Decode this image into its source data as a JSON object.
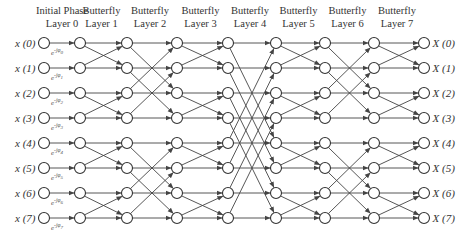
{
  "colors": {
    "line": "#444444",
    "node_stroke": "#333333",
    "text": "#333333",
    "background": "#ffffff"
  },
  "layers": [
    {
      "line1": "Initial Phase",
      "line2": "Layer 0",
      "x": 80
    },
    {
      "line1": "Butterfly",
      "line2": "Layer 1",
      "x": 127
    },
    {
      "line1": "Butterfly",
      "line2": "Layer 2",
      "x": 177
    },
    {
      "line1": "Butterfly",
      "line2": "Layer 3",
      "x": 228
    },
    {
      "line1": "Butterfly",
      "line2": "Layer 4",
      "x": 276
    },
    {
      "line1": "Butterfly",
      "line2": "Layer 5",
      "x": 325
    },
    {
      "line1": "Butterfly",
      "line2": "Layer 6",
      "x": 374
    },
    {
      "line1": "Butterfly",
      "line2": "Layer 7",
      "x": 424
    }
  ],
  "header_x": [
    80,
    102,
    152,
    202,
    252,
    301,
    350,
    399
  ],
  "input_x": 44,
  "rows_y": [
    43,
    68,
    93,
    118,
    143,
    168,
    193,
    218
  ],
  "inputs": [
    "x (0)",
    "x (1)",
    "x (2)",
    "x (3)",
    "x (4)",
    "x (5)",
    "x (6)",
    "x (7)"
  ],
  "outputs": [
    "X (0)",
    "X (1)",
    "X (2)",
    "X (3)",
    "X (4)",
    "X (5)",
    "X (6)",
    "X (7)"
  ],
  "phase_labels": [
    {
      "base": "e",
      "exp": "-jφ",
      "sub": "0"
    },
    {
      "base": "e",
      "exp": "-jφ",
      "sub": "1"
    },
    {
      "base": "e",
      "exp": "-jφ",
      "sub": "2"
    },
    {
      "base": "e",
      "exp": "-jφ",
      "sub": "3"
    },
    {
      "base": "e",
      "exp": "-jφ",
      "sub": "4"
    },
    {
      "base": "e",
      "exp": "-jφ",
      "sub": "5"
    },
    {
      "base": "e",
      "exp": "-jφ",
      "sub": "6"
    },
    {
      "base": "e",
      "exp": "-jφ",
      "sub": "7"
    }
  ],
  "stage_spans": [
    0,
    1,
    2,
    1,
    4,
    1,
    2,
    1
  ],
  "node_radius": 5.5
}
